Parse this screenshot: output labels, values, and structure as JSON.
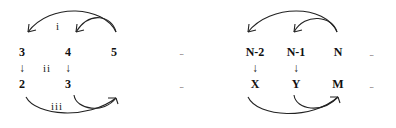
{
  "diagram": {
    "left_group": {
      "top_row": [
        "3",
        "4",
        "5"
      ],
      "bottom_row": [
        "2",
        "3"
      ],
      "down_arrows": [
        "↓",
        "↓"
      ],
      "labels": {
        "top_arc": "i",
        "middle": "ii",
        "bottom_arc": "iii"
      }
    },
    "middle": {
      "top_ellipsis": "...",
      "bottom_ellipsis": "..."
    },
    "right_group": {
      "top_row": [
        "N-2",
        "N-1",
        "N"
      ],
      "bottom_row": [
        "X",
        "Y",
        "M"
      ],
      "down_arrows": [
        "↓",
        "↓"
      ],
      "top_ellipsis": "...",
      "bottom_ellipsis": "..."
    },
    "colors": {
      "ink": "#222222",
      "background": "#ffffff"
    }
  }
}
